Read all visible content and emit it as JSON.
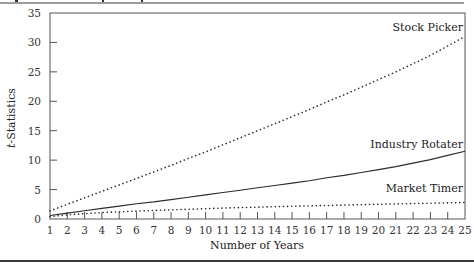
{
  "chart_data": {
    "type": "line",
    "title": "",
    "xlabel": "Number of Years",
    "ylabel": "t-Statistics",
    "ylabel_italic_prefix": "t",
    "ylabel_suffix": "-Statistics",
    "x": [
      1,
      2,
      3,
      4,
      5,
      6,
      7,
      8,
      9,
      10,
      11,
      12,
      13,
      14,
      15,
      16,
      17,
      18,
      19,
      20,
      21,
      22,
      23,
      24,
      25
    ],
    "xlim": [
      1,
      25
    ],
    "ylim": [
      0,
      35
    ],
    "yticks": [
      0,
      5,
      10,
      15,
      20,
      25,
      30,
      35
    ],
    "grid": false,
    "legend": "inline labels at right end of each line",
    "series": [
      {
        "name": "Stock Picker",
        "style": "dotted",
        "values": [
          1.4,
          2.5,
          3.6,
          4.7,
          5.8,
          6.9,
          8.0,
          9.1,
          10.3,
          11.4,
          12.6,
          13.8,
          15.0,
          16.2,
          17.4,
          18.6,
          19.9,
          21.1,
          22.4,
          23.7,
          25.0,
          26.4,
          27.8,
          29.4,
          31.0
        ],
        "label_pos": {
          "x": 463,
          "y": 31
        }
      },
      {
        "name": "Industry Rotater",
        "style": "solid",
        "values": [
          0.6,
          1.0,
          1.4,
          1.8,
          2.2,
          2.6,
          2.9,
          3.3,
          3.7,
          4.1,
          4.5,
          4.9,
          5.3,
          5.7,
          6.1,
          6.5,
          7.0,
          7.4,
          7.9,
          8.4,
          8.9,
          9.5,
          10.1,
          10.8,
          11.5
        ],
        "label_pos": {
          "x": 463,
          "y": 148
        }
      },
      {
        "name": "Market Timer",
        "style": "dotted",
        "values": [
          0.4,
          0.7,
          0.9,
          1.1,
          1.2,
          1.35,
          1.45,
          1.55,
          1.65,
          1.75,
          1.85,
          1.93,
          2.01,
          2.09,
          2.16,
          2.23,
          2.3,
          2.37,
          2.43,
          2.49,
          2.56,
          2.62,
          2.68,
          2.74,
          2.8
        ],
        "label_pos": {
          "x": 463,
          "y": 192
        }
      }
    ]
  },
  "layout": {
    "plot_left": 50,
    "plot_right": 465,
    "plot_top": 13,
    "plot_bottom": 219,
    "colors": {
      "frame": "#555555",
      "line": "#2b2b2b",
      "rule": "#3a3a3a"
    }
  }
}
